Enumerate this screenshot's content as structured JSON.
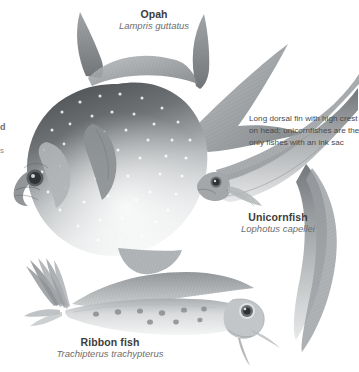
{
  "plate": {
    "kind": "natural-history-illustration",
    "subject": "deep-sea fishes",
    "palette": {
      "background": "#ffffff",
      "ink_dark": "#3c3c3c",
      "ink_mid": "#6e6e6e",
      "caption": "#4a4a4a",
      "body_dark": "#55595c",
      "body_mid": "#9a9ea1",
      "body_light": "#e8e9ea",
      "spot_light": "#ffffff",
      "spot_dark": "#7d8184"
    }
  },
  "labels": {
    "opah": {
      "common": "Opah",
      "scientific": "Lampris guttatus"
    },
    "unicornfish": {
      "common": "Unicornfish",
      "scientific": "Lophotus capellei"
    },
    "ribbonfish": {
      "common": "Ribbon fish",
      "scientific": "Trachipterus trachypterus"
    }
  },
  "captions": {
    "unicornfish": {
      "line1": "Long dorsal fin with high crest",
      "line2": "on head; unicornfishes are the",
      "line3": "only fishes with an ink sac"
    }
  },
  "edge_fragments": {
    "clipped_letter": "d",
    "clipped_mark": "s"
  },
  "figures": [
    {
      "name": "opah",
      "description": "Large deep-bodied disc-shaped fish, dark gray dorsally fading to pale silver ventrally, covered in white spots, with tall sickle dorsal fin, long pectoral fin, pelvic fins and forked caudal fin."
    },
    {
      "name": "unicornfish",
      "description": "Elongate eel-like body curving from upper right to lower right, long continuous dorsal fin with high crest on head, large eye."
    },
    {
      "name": "ribbonfish",
      "description": "Long ribbon-like silvery body with row of dark round spots along the flank, large fan-shaped upturned caudal fin at left, blunt round head with very large eye at right."
    }
  ]
}
